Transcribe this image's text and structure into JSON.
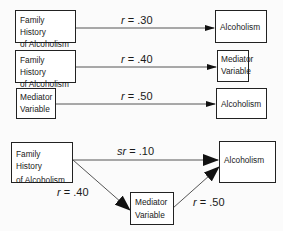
{
  "panels": [
    {
      "name": "total-effect",
      "source": {
        "text_line1": "Family History",
        "text_line2": "of Alcoholism"
      },
      "target": {
        "text_line1": "Alcoholism"
      },
      "path": {
        "stat": "r",
        "value": ".30"
      }
    },
    {
      "name": "a-path",
      "source": {
        "text_line1": "Family History",
        "text_line2": "of Alcoholism"
      },
      "target": {
        "text_line1": "Mediator",
        "text_line2": "Variable"
      },
      "path": {
        "stat": "r",
        "value": ".40"
      }
    },
    {
      "name": "b-path",
      "source": {
        "text_line1": "Mediator",
        "text_line2": "Variable"
      },
      "target": {
        "text_line1": "Alcoholism"
      },
      "path": {
        "stat": "r",
        "value": ".50"
      }
    }
  ],
  "mediation_model": {
    "predictor": {
      "text_line1": "Family History",
      "text_line2": "of Alcoholism"
    },
    "outcome": {
      "text_line1": "Alcoholism"
    },
    "mediator": {
      "text_line1": "Mediator",
      "text_line2": "Variable"
    },
    "direct_path": {
      "stat": "sr",
      "value": ".10"
    },
    "a_path": {
      "stat": "r",
      "value": ".40"
    },
    "b_path": {
      "stat": "r",
      "value": ".50"
    }
  },
  "operator": "="
}
